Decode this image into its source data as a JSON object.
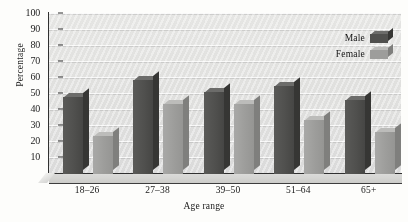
{
  "chart_data": {
    "type": "bar",
    "title": "",
    "subtitle": "",
    "xlabel": "Age range",
    "ylabel": "Percentage",
    "categories": [
      "18–26",
      "27–38",
      "39–50",
      "51–64",
      "65+"
    ],
    "series": [
      {
        "name": "Male",
        "color": "#4e4e4c",
        "values": [
          48,
          59,
          51,
          55,
          46
        ]
      },
      {
        "name": "Female",
        "color": "#9c9c9a",
        "values": [
          24,
          44,
          44,
          34,
          26
        ]
      }
    ],
    "ylim": [
      0,
      100
    ],
    "ytick_values": [
      10,
      20,
      30,
      40,
      50,
      60,
      70,
      80,
      90,
      100
    ],
    "ytick_labels": [
      "10",
      "20",
      "30",
      "40",
      "50",
      "60",
      "70",
      "80",
      "90",
      "100"
    ],
    "grid": true,
    "grid_axis": "y",
    "legend_position": "top-right",
    "style": "3d-bar-grayscale"
  },
  "legend": {
    "entries": [
      {
        "label": "Male"
      },
      {
        "label": "Female"
      }
    ]
  },
  "colors": {
    "male_front": "#4e4e4c",
    "male_side": "#333331",
    "male_top": "#6a6a68",
    "female_front": "#9c9c9a",
    "female_side": "#7e7e7c",
    "female_top": "#bcbcba",
    "plot_background": "#e5e5e3",
    "axis": "#2e2e2e",
    "text": "#151515"
  }
}
